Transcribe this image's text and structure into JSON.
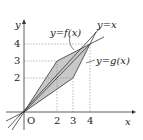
{
  "axes": {
    "x_label": "x",
    "y_label": "y",
    "origin_label": "O",
    "x_ticks": [
      "2",
      "3",
      "4"
    ],
    "y_ticks": [
      "2",
      "3",
      "4"
    ]
  },
  "curves": {
    "f_label": "y=f(x)",
    "g_label": "y=g(x)",
    "identity_label": "y=x"
  },
  "geometry": {
    "f_vertices": [
      [
        0,
        0
      ],
      [
        2,
        3
      ],
      [
        4,
        4
      ]
    ],
    "g_vertices": [
      [
        0,
        0
      ],
      [
        3,
        2
      ],
      [
        4,
        4
      ]
    ],
    "shaded": "region between y=f(x) and y=g(x) for 0≤x≤4"
  },
  "colors": {
    "shade": "#c8c8c8",
    "line": "#333333",
    "dashed": "#888888"
  }
}
